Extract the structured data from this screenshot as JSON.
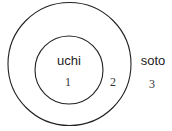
{
  "diagram": {
    "inner_label": "uchi",
    "outer_label": "soto",
    "region_numbers": [
      "1",
      "2",
      "3"
    ],
    "stroke_color": "#222222"
  }
}
